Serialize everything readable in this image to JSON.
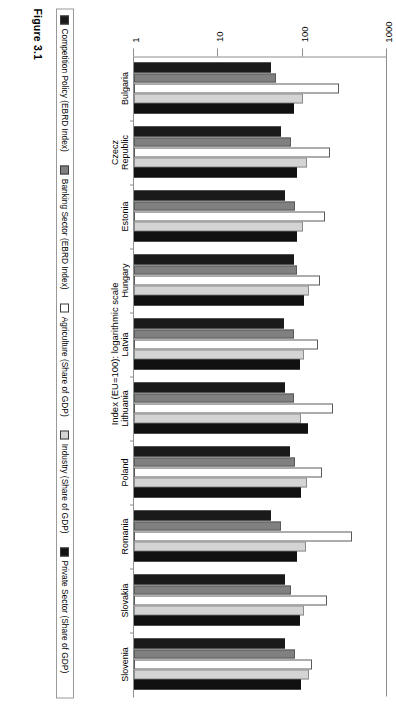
{
  "figure": {
    "caption": "Figure 3.1",
    "axis_title": "Index (EU=100): logarithmic scale"
  },
  "legend": {
    "items": [
      {
        "label": "Competition Policy (EBRD Index)",
        "color": "#1a1a1a",
        "swatch": "solid-black"
      },
      {
        "label": "Banking Sector (EBRD Index)",
        "color": "#808080",
        "swatch": "solid-gray"
      },
      {
        "label": "Agriculture (Share of GDP)",
        "color": "#ffffff",
        "swatch": "outline-white"
      },
      {
        "label": "Industry (Share of GDP)",
        "color": "#d4d4d4",
        "swatch": "light-gray"
      },
      {
        "label": "Private Sector (Share of GDP)",
        "color": "#111111",
        "swatch": "solid-black"
      }
    ]
  },
  "chart_data": {
    "type": "bar",
    "orientation": "horizontal",
    "title": "",
    "subtitle": "",
    "xlabel": "",
    "ylabel": "Index (EU=100): logarithmic scale",
    "scale": "log",
    "ylim": [
      1,
      1000
    ],
    "ticks": [
      "1000",
      "100",
      "10",
      "1"
    ],
    "tick_values": [
      1000,
      100,
      10,
      1
    ],
    "grid": false,
    "legend_position": "bottom",
    "categories": [
      "Bulgaria",
      "Czecz Republic",
      "Estonia",
      "Hungary",
      "Latvia",
      "Lithuania",
      "Poland",
      "Romania",
      "Slovakia",
      "Slovenia"
    ],
    "series": [
      {
        "name": "Competition Policy (EBRD Index)",
        "color": "#1a1a1a",
        "values": [
          42,
          55,
          62,
          78,
          60,
          62,
          70,
          42,
          62,
          62
        ]
      },
      {
        "name": "Banking Sector (EBRD Index)",
        "color": "#808080",
        "values": [
          48,
          72,
          82,
          85,
          78,
          80,
          82,
          55,
          72,
          82
        ]
      },
      {
        "name": "Agriculture (Share of GDP)",
        "color": "#ffffff",
        "values": [
          270,
          210,
          185,
          160,
          150,
          230,
          170,
          380,
          195,
          130
        ]
      },
      {
        "name": "Industry (Share of GDP)",
        "color": "#d4d4d4",
        "values": [
          100,
          112,
          100,
          118,
          105,
          96,
          112,
          110,
          105,
          118
        ]
      },
      {
        "name": "Private Sector (Share of GDP)",
        "color": "#111111",
        "values": [
          78,
          86,
          86,
          105,
          92,
          115,
          96,
          86,
          92,
          96
        ]
      }
    ]
  }
}
